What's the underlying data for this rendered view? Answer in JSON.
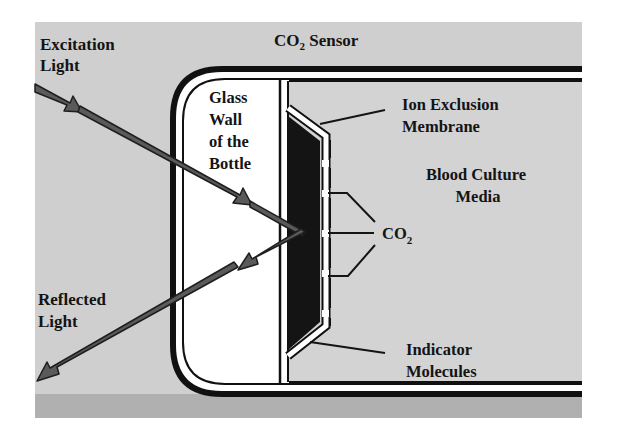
{
  "diagram": {
    "title": {
      "main": "CO",
      "sub": "2",
      "rest": " Sensor"
    },
    "labels": {
      "excitation_light": [
        "Excitation",
        "Light"
      ],
      "reflected_light": [
        "Reflected",
        "Light"
      ],
      "glass_wall": [
        "Glass",
        "Wall",
        "of the",
        "Bottle"
      ],
      "ion_exclusion_membrane": [
        "Ion Exclusion",
        "Membrane"
      ],
      "blood_culture_media": [
        "Blood Culture",
        "Media"
      ],
      "co2": {
        "main": "CO",
        "sub": "2"
      },
      "indicator_molecules": [
        "Indicator",
        "Molecules"
      ]
    },
    "colors": {
      "background_gray": "#cfcfcf",
      "lower_band_gray": "#a9a9a9",
      "bottle_border": "#111111",
      "glass_fill": "#ffffff",
      "media_fill": "#d3d3d3",
      "indicator_fill": "#141414",
      "arrow_fill": "#5a5a5a",
      "arrow_outline": "#1e1e1e"
    }
  }
}
